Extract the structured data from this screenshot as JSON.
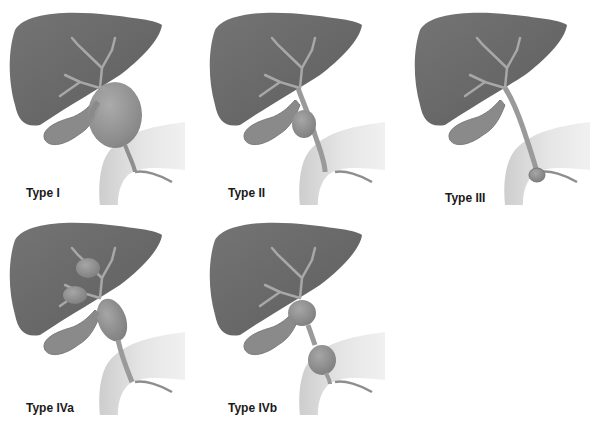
{
  "figure": {
    "panels": [
      {
        "id": "type-i",
        "label": "Type I",
        "cysts": "fusiform dilation of common bile duct"
      },
      {
        "id": "type-ii",
        "label": "Type II",
        "cysts": "diverticulum of common bile duct"
      },
      {
        "id": "type-iii",
        "label": "Type III",
        "cysts": "choledochocele at duodenal wall"
      },
      {
        "id": "type-iva",
        "label": "Type IVa",
        "cysts": "intrahepatic and extrahepatic cysts"
      },
      {
        "id": "type-ivb",
        "label": "Type IVb",
        "cysts": "multiple extrahepatic cysts"
      }
    ],
    "colors": {
      "liver": "#6a6a6a",
      "duct": "#9c9c9c",
      "cyst": "#8e8e8e",
      "gallbladder": "#8a8a8a",
      "duodenum": "#d9d9d9",
      "background": "#ffffff"
    }
  }
}
